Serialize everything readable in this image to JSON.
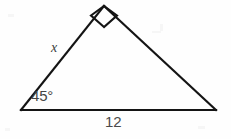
{
  "figure": {
    "type": "right-triangle-diagram",
    "background_color": "#fefefe",
    "stroke_color": "#141414",
    "label_color": "#4a4a4a",
    "labels": {
      "leg_label": "x",
      "angle_label": "45°",
      "base_label": "12"
    },
    "geometry": {
      "apex": [
        104,
        6
      ],
      "left_vertex": [
        21,
        110
      ],
      "right_vertex": [
        216,
        110
      ],
      "right_angle_at": "apex",
      "known_angle_at": "left_vertex",
      "known_angle_degrees": 45,
      "known_side": "base",
      "known_side_length": 12,
      "unknown_side": "left_leg",
      "unknown_side_label": "x"
    },
    "right_angle_marker": {
      "shape": "square",
      "points": "104,27 91,15.5 104,6 117,15.5"
    },
    "paths": {
      "left_leg": "M 21 110 L 104 6",
      "right_leg": "M 104 6 L 216 110",
      "base": "M 21 110 L 216 110"
    }
  }
}
